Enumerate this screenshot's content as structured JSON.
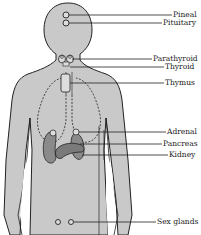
{
  "diagram": {
    "title": "",
    "type": "endocrine-glands-anatomy",
    "colors": {
      "body_fill": "#c9c9c9",
      "organ_fill": "#8a8a8a",
      "outline": "#222222",
      "background": "#ffffff"
    },
    "labels": [
      {
        "id": "pineal",
        "text": "Pineal"
      },
      {
        "id": "pituitary",
        "text": "Pituitary"
      },
      {
        "id": "parathyroid",
        "text": "Parathyroid"
      },
      {
        "id": "thyroid",
        "text": "Thyroid"
      },
      {
        "id": "thymus",
        "text": "Thymus"
      },
      {
        "id": "adrenal",
        "text": "Adrenal"
      },
      {
        "id": "pancreas",
        "text": "Pancreas"
      },
      {
        "id": "kidney",
        "text": "Kidney"
      },
      {
        "id": "sex-glands",
        "text": "Sex glands"
      }
    ]
  }
}
